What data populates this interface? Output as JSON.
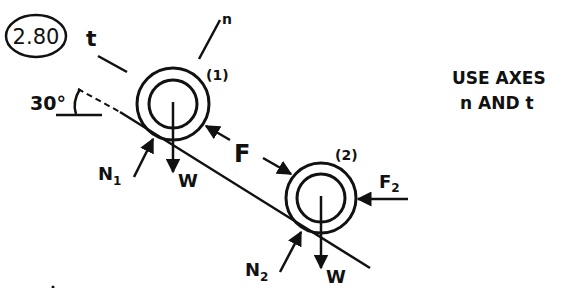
{
  "problem": {
    "number": "2.80",
    "instruction_line1": "USE AXES",
    "instruction_line2": "n AND t"
  },
  "axes": {
    "n_label": "n",
    "t_label": "t"
  },
  "incline": {
    "angle_label": "30°"
  },
  "cylinders": [
    {
      "id_label": "(1)",
      "weight_label": "W",
      "normal_label": "N",
      "normal_subscript": "1"
    },
    {
      "id_label": "(2)",
      "weight_label": "W",
      "normal_label": "N",
      "normal_subscript": "2"
    }
  ],
  "forces": {
    "contact_force_label": "F",
    "horizontal_force_label": "F",
    "horizontal_force_subscript": "2"
  },
  "colors": {
    "ink": "#111111",
    "paper": "#ffffff"
  }
}
